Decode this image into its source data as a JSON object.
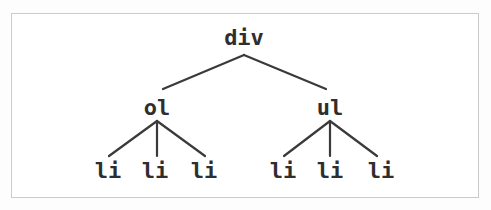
{
  "tree": {
    "root": {
      "label": "div"
    },
    "children": [
      {
        "label": "ol",
        "children": [
          {
            "label": "li"
          },
          {
            "label": "li"
          },
          {
            "label": "li"
          }
        ]
      },
      {
        "label": "ul",
        "children": [
          {
            "label": "li"
          },
          {
            "label": "li"
          },
          {
            "label": "li"
          }
        ]
      }
    ]
  },
  "colors": {
    "edge": "#3a3a3a",
    "text": "#2e2e2e",
    "frame_border": "#cbcbcb",
    "frame_background": "#ffffff",
    "page_background": "#fdfdfd"
  }
}
